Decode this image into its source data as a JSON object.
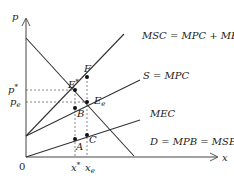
{
  "diagram": {
    "type": "economics-externality-supply-demand",
    "axes": {
      "y_label": "p",
      "x_label": "x",
      "origin_label": "0"
    },
    "curves": {
      "msc": {
        "label": "MSC = MPC + MEC"
      },
      "supply": {
        "label": "S = MPC"
      },
      "mec": {
        "label": "MEC"
      },
      "demand": {
        "label": "D = MPB = MSB"
      }
    },
    "points": {
      "e_star": {
        "label": "E",
        "sup": "*"
      },
      "f": {
        "label": "F"
      },
      "e_e": {
        "label": "E",
        "sub": "e"
      },
      "b": {
        "label": "B"
      },
      "a": {
        "label": "A"
      },
      "c": {
        "label": "C"
      }
    },
    "ticks": {
      "p_star": {
        "label": "p",
        "sup": "*"
      },
      "p_e": {
        "label": "p",
        "sub": "e"
      },
      "x_star": {
        "label": "x",
        "sup": "*"
      },
      "x_e": {
        "label": "x",
        "sub": "e"
      }
    },
    "colors": {
      "line": "#333333",
      "dashed": "#555555",
      "text": "#222222"
    }
  }
}
